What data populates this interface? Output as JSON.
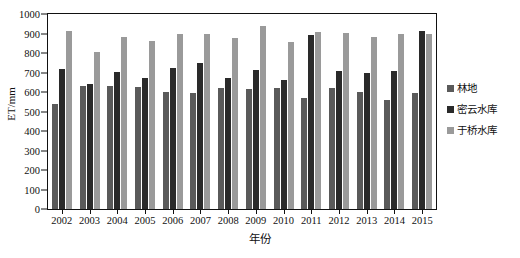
{
  "chart_data": {
    "type": "bar",
    "title": "",
    "xlabel": "年份",
    "ylabel": "ET/mm",
    "ylim": [
      0,
      1000
    ],
    "ytick_step": 100,
    "yticks": [
      0,
      100,
      200,
      300,
      400,
      500,
      600,
      700,
      800,
      900,
      1000
    ],
    "ytick_labels": [
      "0",
      "100",
      "200",
      "300",
      "400",
      "500",
      "600",
      "700",
      "800",
      "900",
      "1000"
    ],
    "grid": false,
    "legend_position": "right",
    "categories": [
      "2002",
      "2003",
      "2004",
      "2005",
      "2006",
      "2007",
      "2008",
      "2009",
      "2010",
      "2011",
      "2012",
      "2013",
      "2014",
      "2015"
    ],
    "series": [
      {
        "name": "林地",
        "color": "#5a5a5a",
        "values": [
          540,
          630,
          630,
          625,
          600,
          595,
          620,
          615,
          620,
          570,
          620,
          600,
          560,
          595
        ]
      },
      {
        "name": "密云水库",
        "color": "#2a2a2a",
        "values": [
          720,
          640,
          705,
          670,
          725,
          750,
          670,
          715,
          660,
          890,
          710,
          700,
          710,
          915
        ]
      },
      {
        "name": "于桥水库",
        "color": "#9a9a9a",
        "values": [
          915,
          805,
          880,
          860,
          900,
          895,
          875,
          940,
          855,
          910,
          905,
          880,
          900,
          900
        ]
      }
    ]
  },
  "legend": {
    "items": [
      {
        "label": "林地",
        "color": "#5a5a5a"
      },
      {
        "label": "密云水库",
        "color": "#2a2a2a"
      },
      {
        "label": "于桥水库",
        "color": "#9a9a9a"
      }
    ]
  },
  "axes": {
    "y_title": "ET/mm",
    "x_title": "年份"
  }
}
